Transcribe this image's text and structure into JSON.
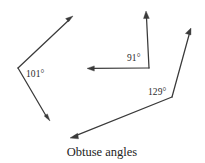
{
  "figure": {
    "title": "Obtuse angles",
    "caption": "Obtuse angles",
    "background_color": "#ffffff",
    "stroke_color": "#3a3a3a",
    "text_color": "#232323",
    "angles": [
      {
        "id": "angle-left",
        "label": "101°",
        "measure": 101,
        "unit": "degrees",
        "vertex": {
          "x": 18,
          "y": 68
        },
        "label_position": {
          "x": 26,
          "y": 77
        },
        "rays": [
          {
            "id": "ray-upper-left",
            "direction": "up-right",
            "tip": {
              "x": 73,
              "y": 16
            },
            "has_arrowhead": true
          },
          {
            "id": "ray-lower-left",
            "direction": "down-right",
            "tip": {
              "x": 50,
              "y": 121
            },
            "has_arrowhead": true
          }
        ]
      },
      {
        "id": "angle-middle",
        "label": "91°",
        "measure": 91,
        "unit": "degrees",
        "vertex": {
          "x": 149,
          "y": 68
        },
        "label_position": {
          "x": 127,
          "y": 61
        },
        "rays": [
          {
            "id": "ray-vertical-up",
            "direction": "up",
            "tip": {
              "x": 146,
              "y": 11
            },
            "has_arrowhead": true
          },
          {
            "id": "ray-horizontal-left",
            "direction": "left",
            "tip": {
              "x": 87,
              "y": 68
            },
            "has_arrowhead": true
          }
        ]
      },
      {
        "id": "angle-right",
        "label": "129°",
        "measure": 129,
        "unit": "degrees",
        "vertex": {
          "x": 172,
          "y": 97
        },
        "label_position": {
          "x": 148,
          "y": 95
        },
        "rays": [
          {
            "id": "ray-upper-right",
            "direction": "up-right",
            "tip": {
              "x": 191,
              "y": 28
            },
            "has_arrowhead": true
          },
          {
            "id": "ray-lower-long-left",
            "direction": "down-left",
            "tip": {
              "x": 70,
              "y": 138
            },
            "has_arrowhead": true
          }
        ]
      }
    ],
    "caption_position": {
      "x": 102,
      "y": 156
    }
  }
}
